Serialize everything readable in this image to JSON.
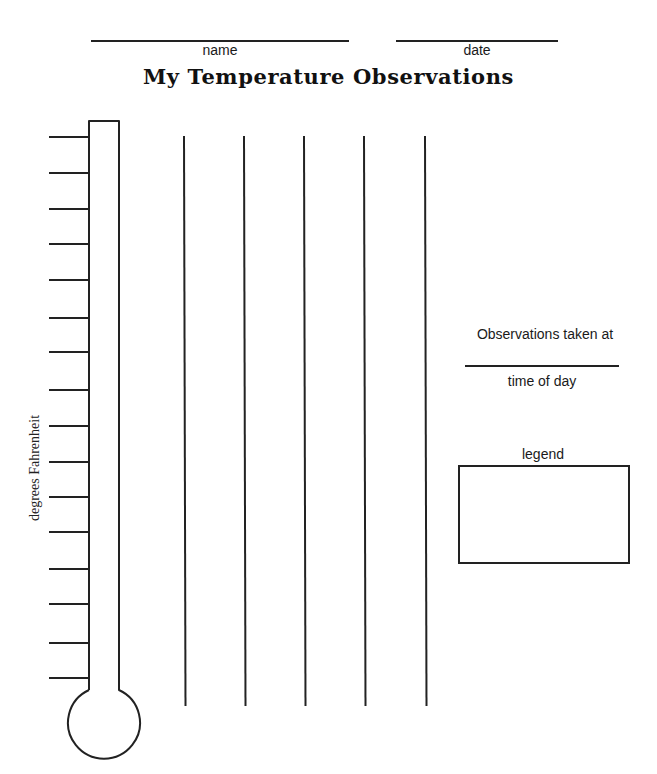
{
  "header": {
    "name_label": "name",
    "date_label": "date",
    "title": "My Temperature Observations"
  },
  "thermometer": {
    "axis_label": "degrees Fahrenheit",
    "tick_count": 16,
    "tick_y": [
      137,
      173,
      209,
      244,
      280,
      318,
      352,
      390,
      426,
      462,
      497,
      532,
      569,
      604,
      643,
      678
    ]
  },
  "grid": {
    "column_line_count": 5,
    "column_line_x": [
      184,
      244,
      304,
      364,
      425
    ]
  },
  "side_panel": {
    "observations_label": "Observations taken at",
    "time_of_day_label": "time of day",
    "legend_label": "legend"
  },
  "colors": {
    "ink": "#222222",
    "paper": "#ffffff"
  }
}
